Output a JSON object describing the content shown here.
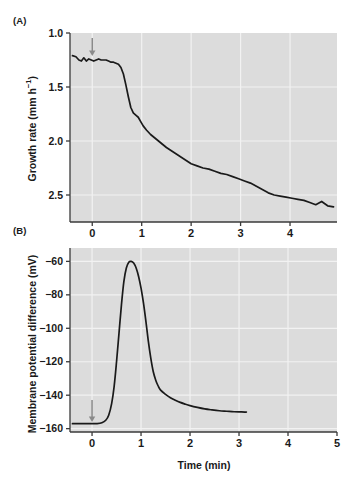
{
  "figure": {
    "panel_a_label": "(A)",
    "panel_b_label": "(B)",
    "x_axis_title": "Time (min)"
  },
  "panel_a": {
    "y_axis_title_main": "Growth rate (mm h",
    "y_axis_title_sup": "−1",
    "y_axis_title_close": ")",
    "annotation": "Decrease in growth rate",
    "arrow_label": "Blue light on",
    "arrow_name": "blue-light-onset-arrow",
    "y_ticks": [
      "2.5",
      "2.0",
      "1.5",
      "1.0"
    ],
    "x_ticks": [
      "0",
      "1",
      "2",
      "3",
      "4"
    ]
  },
  "panel_b": {
    "y_axis_title": "Membrane potential difference (mV)",
    "annotation_line1": "Transient membrane",
    "annotation_line2": "depolarization",
    "arrow_name": "blue-light-onset-arrow",
    "y_ticks": [
      "−60",
      "−80",
      "−100",
      "−120",
      "−140",
      "−160"
    ],
    "x_ticks": [
      "0",
      "1",
      "2",
      "3",
      "4",
      "5"
    ]
  },
  "colors": {
    "plot_background": "#dcdcdc",
    "gridline": "#f2f2f2",
    "curve": "#1a1a1a",
    "axis": "#3a3a3a",
    "arrow": "#8a8a8a",
    "text": "#1a1a1a"
  },
  "chart_data": [
    {
      "type": "line",
      "panel": "A",
      "title": "",
      "xlabel": "Time (min)",
      "ylabel": "Growth rate (mm h−1)",
      "xlim": [
        -0.45,
        4.95
      ],
      "ylim": [
        0.75,
        2.5
      ],
      "grid": true,
      "xticks": [
        0,
        1,
        2,
        3,
        4
      ],
      "yticks": [
        1.0,
        1.5,
        2.0,
        2.5
      ],
      "annotations": [
        {
          "text": "Blue light on",
          "x": 0,
          "y": 2.42,
          "type": "arrow-label"
        },
        {
          "text": "Decrease in growth rate",
          "x": 2.6,
          "y": 1.78,
          "type": "text"
        }
      ],
      "series": [
        {
          "name": "growth rate",
          "x": [
            -0.4,
            -0.33,
            -0.27,
            -0.22,
            -0.17,
            -0.12,
            -0.07,
            -0.02,
            0.03,
            0.08,
            0.13,
            0.18,
            0.23,
            0.28,
            0.33,
            0.38,
            0.43,
            0.48,
            0.53,
            0.58,
            0.63,
            0.68,
            0.73,
            0.78,
            0.83,
            0.88,
            0.93,
            0.98,
            1.03,
            1.1,
            1.18,
            1.26,
            1.34,
            1.42,
            1.5,
            1.6,
            1.7,
            1.8,
            1.9,
            2.0,
            2.12,
            2.24,
            2.36,
            2.48,
            2.6,
            2.72,
            2.84,
            2.96,
            3.08,
            3.2,
            3.32,
            3.44,
            3.56,
            3.68,
            3.8,
            3.92,
            4.04,
            4.16,
            4.28,
            4.4,
            4.52,
            4.64,
            4.76,
            4.88
          ],
          "y": [
            2.29,
            2.28,
            2.25,
            2.24,
            2.27,
            2.24,
            2.26,
            2.25,
            2.24,
            2.25,
            2.26,
            2.25,
            2.25,
            2.25,
            2.24,
            2.23,
            2.23,
            2.22,
            2.21,
            2.18,
            2.12,
            2.02,
            1.91,
            1.81,
            1.76,
            1.74,
            1.72,
            1.68,
            1.64,
            1.6,
            1.56,
            1.53,
            1.5,
            1.47,
            1.44,
            1.41,
            1.38,
            1.35,
            1.32,
            1.29,
            1.27,
            1.25,
            1.24,
            1.22,
            1.2,
            1.19,
            1.17,
            1.15,
            1.13,
            1.11,
            1.08,
            1.05,
            1.02,
            1.0,
            0.99,
            0.98,
            0.97,
            0.96,
            0.95,
            0.93,
            0.91,
            0.94,
            0.9,
            0.89
          ]
        }
      ]
    },
    {
      "type": "line",
      "panel": "B",
      "title": "",
      "xlabel": "Time (min)",
      "ylabel": "Membrane potential difference (mV)",
      "xlim": [
        -0.45,
        5.0
      ],
      "ylim": [
        -162,
        -52
      ],
      "grid": true,
      "xticks": [
        0,
        1,
        2,
        3,
        4,
        5
      ],
      "yticks": [
        -60,
        -80,
        -100,
        -120,
        -140,
        -160
      ],
      "annotations": [
        {
          "text": "Transient membrane depolarization",
          "x": 3.1,
          "y": -97,
          "type": "text"
        },
        {
          "text": "",
          "x": 0,
          "y": -157,
          "type": "arrow"
        }
      ],
      "series": [
        {
          "name": "membrane potential difference",
          "x": [
            -0.4,
            -0.25,
            -0.1,
            0.0,
            0.1,
            0.2,
            0.28,
            0.34,
            0.4,
            0.45,
            0.5,
            0.55,
            0.6,
            0.65,
            0.7,
            0.75,
            0.8,
            0.85,
            0.9,
            0.95,
            1.0,
            1.05,
            1.1,
            1.15,
            1.2,
            1.25,
            1.3,
            1.35,
            1.4,
            1.5,
            1.6,
            1.7,
            1.8,
            1.9,
            2.0,
            2.15,
            2.3,
            2.45,
            2.6,
            2.75,
            2.9,
            3.05,
            3.15
          ],
          "y": [
            -157.0,
            -157.0,
            -157.0,
            -157.0,
            -157.0,
            -156.5,
            -155.0,
            -152.0,
            -145.0,
            -135.0,
            -120.0,
            -103.0,
            -86.0,
            -72.0,
            -64.0,
            -60.5,
            -60.0,
            -61.0,
            -64.0,
            -69.0,
            -76.0,
            -85.0,
            -96.0,
            -108.0,
            -118.0,
            -126.0,
            -131.0,
            -134.5,
            -137.0,
            -139.5,
            -141.5,
            -143.0,
            -144.3,
            -145.3,
            -146.2,
            -147.3,
            -148.2,
            -148.8,
            -149.3,
            -149.6,
            -149.9,
            -150.0,
            -150.1
          ]
        }
      ]
    }
  ]
}
